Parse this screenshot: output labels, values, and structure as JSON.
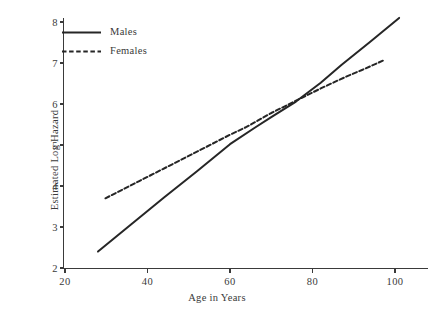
{
  "chart_data": {
    "type": "line",
    "title": "",
    "xlabel": "Age in Years",
    "ylabel": "Estimated Log Hazard",
    "xlim": [
      18,
      106
    ],
    "ylim": [
      1.85,
      8.25
    ],
    "xticks": [
      20,
      40,
      60,
      80,
      100
    ],
    "yticks": [
      2,
      3,
      4,
      5,
      6,
      7,
      8
    ],
    "xtick_labels": [
      "20",
      "40",
      "60",
      "80",
      "100"
    ],
    "ytick_labels": [
      "2",
      "3",
      "4",
      "5",
      "6",
      "7",
      "8"
    ],
    "grid": false,
    "legend_position": "top-left",
    "series": [
      {
        "name": "Males",
        "style": "solid",
        "color": "#262626",
        "x": [
          28.0,
          36.0,
          44.0,
          52.0,
          60.0,
          66.0,
          70.0,
          76.0,
          82.0,
          87.0,
          94.0,
          101.0
        ],
        "values": [
          2.4,
          3.06,
          3.72,
          4.36,
          5.02,
          5.42,
          5.68,
          6.06,
          6.52,
          6.95,
          7.52,
          8.1
        ]
      },
      {
        "name": "Females",
        "style": "dashed",
        "color": "#262626",
        "x": [
          29.8,
          38.0,
          46.0,
          54.0,
          60.0,
          64.0,
          70.0,
          76.0,
          82.0,
          88.0,
          92.0,
          97.6
        ],
        "values": [
          3.7,
          4.12,
          4.53,
          4.94,
          5.25,
          5.44,
          5.78,
          6.08,
          6.38,
          6.66,
          6.83,
          7.08
        ]
      }
    ],
    "legend": [
      {
        "label": "Males",
        "style": "solid"
      },
      {
        "label": "Females",
        "style": "dashed"
      }
    ],
    "annotations": []
  }
}
